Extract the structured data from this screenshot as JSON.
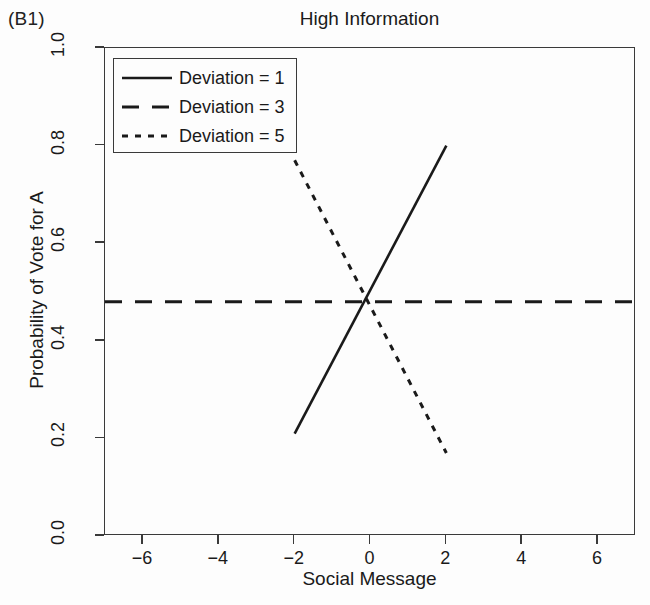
{
  "panel": {
    "label": "(B1)"
  },
  "chart_data": {
    "type": "line",
    "title": "High Information",
    "xlabel": "Social Message",
    "ylabel": "Probability of Vote for A",
    "xlim": [
      -7,
      7
    ],
    "ylim": [
      0.0,
      1.0
    ],
    "xticks": [
      -6,
      -4,
      -2,
      0,
      2,
      4,
      6
    ],
    "xticklabels": [
      "−6",
      "−4",
      "−2",
      "0",
      "2",
      "4",
      "6"
    ],
    "yticks": [
      0.0,
      0.2,
      0.4,
      0.6,
      0.8,
      1.0
    ],
    "yticklabels": [
      "0.0",
      "0.2",
      "0.4",
      "0.6",
      "0.8",
      "1.0"
    ],
    "grid": false,
    "legend_position": "top-left",
    "line_color": "#1a1a1a",
    "series": [
      {
        "name": "Deviation = 1",
        "style": "solid",
        "x": [
          -2,
          2
        ],
        "y": [
          0.21,
          0.8
        ]
      },
      {
        "name": "Deviation = 3",
        "style": "dashed",
        "x": [
          -7,
          7
        ],
        "y": [
          0.48,
          0.48
        ]
      },
      {
        "name": "Deviation = 5",
        "style": "dotted",
        "x": [
          -2,
          2
        ],
        "y": [
          0.77,
          0.17
        ]
      }
    ],
    "annotations": [
      {
        "text": "lines intersect near x = -0.2, y = 0.48"
      }
    ]
  },
  "legend": {
    "entries": [
      {
        "label": "Deviation = 1",
        "style": "solid"
      },
      {
        "label": "Deviation = 3",
        "style": "dashed"
      },
      {
        "label": "Deviation = 5",
        "style": "dotted"
      }
    ]
  }
}
